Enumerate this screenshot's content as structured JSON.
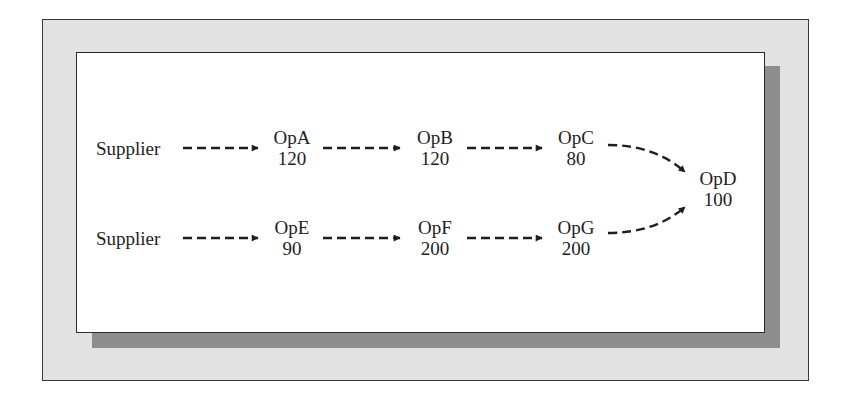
{
  "diagram": {
    "type": "process-flow",
    "rows": [
      {
        "source": "Supplier",
        "operations": [
          {
            "name": "OpA",
            "value": "120"
          },
          {
            "name": "OpB",
            "value": "120"
          },
          {
            "name": "OpC",
            "value": "80"
          }
        ]
      },
      {
        "source": "Supplier",
        "operations": [
          {
            "name": "OpE",
            "value": "90"
          },
          {
            "name": "OpF",
            "value": "200"
          },
          {
            "name": "OpG",
            "value": "200"
          }
        ]
      }
    ],
    "merge": {
      "name": "OpD",
      "value": "100"
    },
    "edges": [
      [
        "Supplier",
        "OpA"
      ],
      [
        "OpA",
        "OpB"
      ],
      [
        "OpB",
        "OpC"
      ],
      [
        "OpC",
        "OpD"
      ],
      [
        "Supplier",
        "OpE"
      ],
      [
        "OpE",
        "OpF"
      ],
      [
        "OpF",
        "OpG"
      ],
      [
        "OpG",
        "OpD"
      ]
    ],
    "edge_style": "dashed-arrow",
    "colors": {
      "outer_frame": "#e2e2e2",
      "shadow": "#8e8e8e",
      "panel": "#ffffff",
      "ink": "#1e1e1e"
    }
  }
}
